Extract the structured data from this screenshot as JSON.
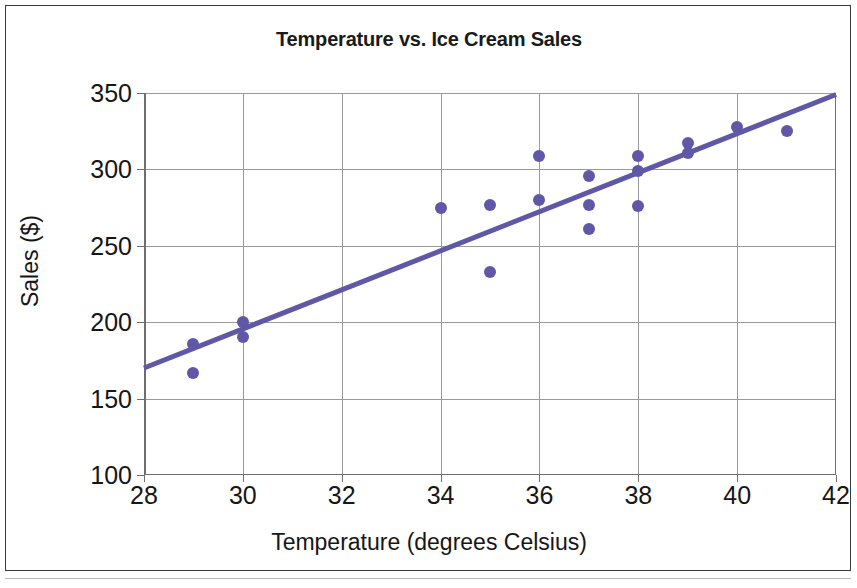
{
  "chart_data": {
    "type": "scatter",
    "title": "Temperature vs. Ice Cream Sales",
    "xlabel": "Temperature (degrees Celsius)",
    "ylabel": "Sales ($)",
    "xlim": [
      28,
      42
    ],
    "ylim": [
      100,
      350
    ],
    "xticks": [
      28,
      30,
      32,
      34,
      36,
      38,
      40,
      42
    ],
    "yticks": [
      100,
      150,
      200,
      250,
      300,
      350
    ],
    "grid": true,
    "legend": null,
    "marker_color": "#5f58a6",
    "trendline_color": "#5f58a6",
    "points": [
      {
        "x": 29,
        "y": 186
      },
      {
        "x": 29,
        "y": 167
      },
      {
        "x": 30,
        "y": 200
      },
      {
        "x": 30,
        "y": 190
      },
      {
        "x": 34,
        "y": 275
      },
      {
        "x": 35,
        "y": 277
      },
      {
        "x": 35,
        "y": 233
      },
      {
        "x": 36,
        "y": 309
      },
      {
        "x": 36,
        "y": 280
      },
      {
        "x": 37,
        "y": 296
      },
      {
        "x": 37,
        "y": 277
      },
      {
        "x": 37,
        "y": 261
      },
      {
        "x": 38,
        "y": 309
      },
      {
        "x": 38,
        "y": 299
      },
      {
        "x": 38,
        "y": 276
      },
      {
        "x": 39,
        "y": 317
      },
      {
        "x": 39,
        "y": 311
      },
      {
        "x": 40,
        "y": 328
      },
      {
        "x": 41,
        "y": 325
      }
    ],
    "trendline": {
      "x1": 28,
      "y1": 170,
      "x2": 42,
      "y2": 349
    }
  }
}
